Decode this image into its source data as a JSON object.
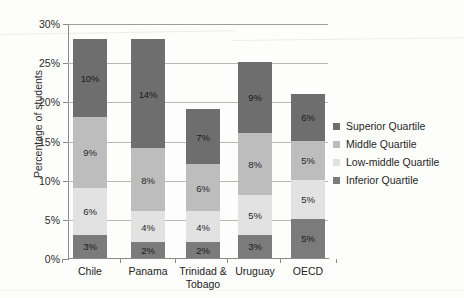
{
  "chart_data": {
    "type": "bar",
    "stacked": true,
    "title": "",
    "xlabel": "",
    "ylabel": "Percentage of students",
    "ylim": [
      0,
      30
    ],
    "ytick_labels": [
      "0%",
      "5%",
      "10%",
      "15%",
      "20%",
      "25%",
      "30%"
    ],
    "ytick_values": [
      0,
      5,
      10,
      15,
      20,
      25,
      30
    ],
    "grid": true,
    "legend_position": "right",
    "categories": [
      "Chile",
      "Panama",
      "Trinidad & Tobago",
      "Uruguay",
      "OECD"
    ],
    "category_lines": [
      [
        "Chile"
      ],
      [
        "Panama"
      ],
      [
        "Trinidad &",
        "Tobago"
      ],
      [
        "Uruguay"
      ],
      [
        "OECD"
      ]
    ],
    "series": [
      {
        "name": "Inferior Quartile",
        "color": "#7b7b7b",
        "values": [
          3,
          2,
          2,
          3,
          5
        ],
        "labels": [
          "3%",
          "2%",
          "2%",
          "3%",
          "5%"
        ]
      },
      {
        "name": "Low-middle Quartile",
        "color": "#e2e2e2",
        "values": [
          6,
          4,
          4,
          5,
          5
        ],
        "labels": [
          "6%",
          "4%",
          "4%",
          "5%",
          "5%"
        ]
      },
      {
        "name": "Middle Quartile",
        "color": "#bdbdbd",
        "values": [
          9,
          8,
          6,
          8,
          5
        ],
        "labels": [
          "9%",
          "8%",
          "6%",
          "8%",
          "5%"
        ]
      },
      {
        "name": "Superior Quartile",
        "color": "#6e6e6e",
        "values": [
          10,
          14,
          7,
          9,
          6
        ],
        "labels": [
          "10%",
          "14%",
          "7%",
          "9%",
          "6%"
        ]
      }
    ],
    "totals": [
      28,
      28,
      19,
      25,
      21
    ]
  },
  "legend": {
    "items": [
      {
        "label": "Superior Quartile",
        "color": "#6e6e6e"
      },
      {
        "label": "Middle Quartile",
        "color": "#bdbdbd"
      },
      {
        "label": "Low-middle Quartile",
        "color": "#e2e2e2"
      },
      {
        "label": "Inferior Quartile",
        "color": "#7b7b7b"
      }
    ]
  }
}
